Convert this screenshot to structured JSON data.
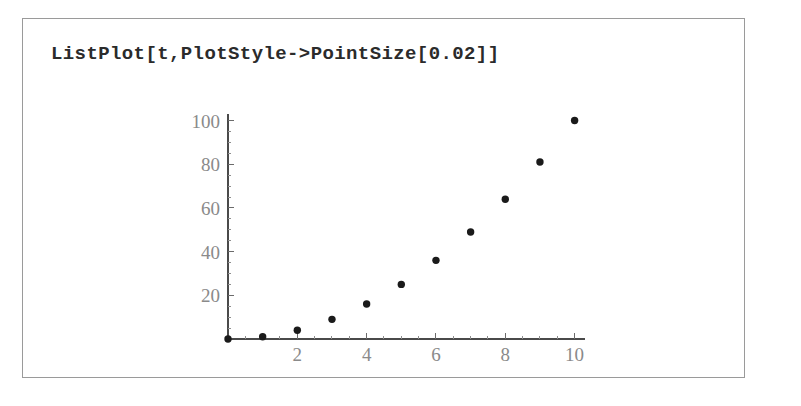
{
  "window": {
    "background_color": "#ffffff",
    "frame_border_color": "#9a9a9a"
  },
  "input_cell": {
    "expression": "ListPlot[t,PlotStyle->PointSize[0.02]]"
  },
  "chart_data": {
    "type": "scatter",
    "title": "",
    "xlabel": "",
    "ylabel": "",
    "x": [
      0,
      1,
      2,
      3,
      4,
      5,
      6,
      7,
      8,
      9,
      10
    ],
    "values": [
      0,
      1,
      4,
      9,
      16,
      25,
      36,
      49,
      64,
      81,
      100
    ],
    "series": [
      {
        "name": "t",
        "values": [
          0,
          1,
          4,
          9,
          16,
          25,
          36,
          49,
          64,
          81,
          100
        ]
      }
    ],
    "xlim": [
      0,
      10.3
    ],
    "ylim": [
      0,
      103
    ],
    "x_ticks_major": [
      2,
      4,
      6,
      8,
      10
    ],
    "x_tick_labels": [
      "2",
      "4",
      "6",
      "8",
      "10"
    ],
    "x_minor_step": 0.5,
    "y_ticks_major": [
      20,
      40,
      60,
      80,
      100
    ],
    "y_tick_labels": [
      "20",
      "40",
      "60",
      "80",
      "100"
    ],
    "y_minor_step": 5,
    "grid": false,
    "legend": false,
    "point_size": 0.02,
    "point_color": "#1a1a1a",
    "axis_color": "#4a4a4a",
    "tick_label_color": "#8a8a8a"
  }
}
